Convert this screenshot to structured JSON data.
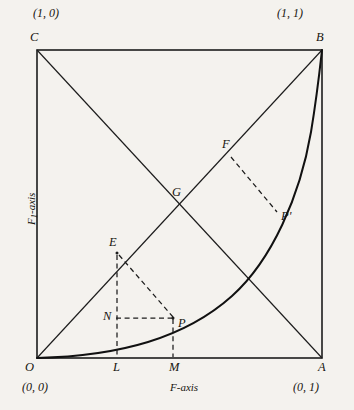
{
  "figure": {
    "background_color": "#f4f2ee",
    "line_color": "#1c1c1c"
  },
  "axes": {
    "x_label": "F-axis",
    "y_label_main": "F",
    "y_label_sub": "1",
    "y_label_tail": "-axis"
  },
  "corner_coords": {
    "top_left": "(1, 0)",
    "top_right": "(1, 1)",
    "bottom_left": "(0, 0)",
    "bottom_right": "(0, 1)"
  },
  "vertices": {
    "c": "C",
    "b": "B",
    "o": "O",
    "a": "A"
  },
  "points": {
    "e": "E",
    "f": "F",
    "g": "G",
    "n": "N",
    "p": "P",
    "p_prime": "P'",
    "l": "L",
    "m": "M"
  },
  "geometry": {
    "square": {
      "left": 37,
      "top": 50,
      "right": 322,
      "bottom": 358
    },
    "diagonal_main": "O to B",
    "diagonal_anti": "C to A",
    "curve": "convex curve from O to B tangent to bottom edge at O",
    "curve_exponent": 3.1,
    "point_positions": {
      "E": [
        117,
        252
      ],
      "L": [
        117,
        358
      ],
      "N": [
        117,
        318
      ],
      "P": [
        173,
        318
      ],
      "M": [
        173,
        358
      ],
      "G": [
        180,
        204
      ],
      "F": [
        228,
        153
      ],
      "P_prime": [
        278,
        214
      ]
    },
    "dashed_segments": [
      "E to L (vertical)",
      "N to P (horizontal)",
      "E to P (hypotenuse)",
      "P to M (vertical)",
      "F to P' (perpendicular to diagonal)"
    ]
  }
}
